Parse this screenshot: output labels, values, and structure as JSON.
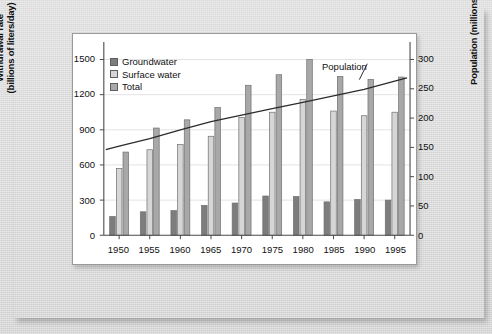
{
  "figure": {
    "background_color": "#d9d9d9",
    "plot_background_color": "#ffffff"
  },
  "legend": {
    "position": "top-left-inside",
    "items": [
      {
        "label": "Groundwater",
        "color": "#7d7d7d",
        "icon": "legend-swatch-icon"
      },
      {
        "label": "Surface water",
        "color": "#d6d6d6",
        "icon": "legend-swatch-icon"
      },
      {
        "label": "Total",
        "color": "#a8a8a8",
        "icon": "legend-swatch-icon"
      }
    ]
  },
  "annotations": [
    {
      "text": "Population",
      "target": "population-trend-line"
    }
  ],
  "chart_data": {
    "type": "bar",
    "title": "",
    "xlabel": "",
    "ylabel": "Withdrawal rate\n(billions of liters/day)",
    "y2label": "Population (millions)",
    "grid": true,
    "categories": [
      "1950",
      "1955",
      "1960",
      "1965",
      "1970",
      "1975",
      "1980",
      "1985",
      "1990",
      "1995"
    ],
    "ylim": [
      0,
      1650
    ],
    "yticks": [
      0,
      300,
      600,
      900,
      1200,
      1500
    ],
    "ytick_labels": [
      "0",
      "300",
      "600",
      "900",
      "1200",
      "1500"
    ],
    "y2lim": [
      0,
      330
    ],
    "y2ticks": [
      0,
      50,
      100,
      150,
      200,
      250,
      300
    ],
    "y2tick_labels": [
      "0",
      "50",
      "100",
      "150",
      "200",
      "250",
      "300"
    ],
    "series": [
      {
        "name": "Groundwater",
        "color": "#7d7d7d",
        "axis": "left",
        "values": [
          160,
          200,
          210,
          255,
          275,
          335,
          330,
          285,
          305,
          300
        ]
      },
      {
        "name": "Surface water",
        "color": "#d6d6d6",
        "axis": "left",
        "values": [
          570,
          730,
          775,
          845,
          1005,
          1050,
          1160,
          1060,
          1020,
          1050
        ]
      },
      {
        "name": "Total",
        "color": "#a8a8a8",
        "axis": "left",
        "values": [
          710,
          915,
          985,
          1090,
          1280,
          1370,
          1500,
          1355,
          1330,
          1350
        ]
      }
    ],
    "line_series": [
      {
        "name": "Population",
        "color": "#2b2b2b",
        "axis": "right",
        "x": [
          "1950",
          "1955",
          "1960",
          "1965",
          "1970",
          "1975",
          "1980",
          "1985",
          "1990",
          "1995"
        ],
        "values": [
          152,
          165,
          180,
          194,
          205,
          216,
          227,
          238,
          249,
          263
        ]
      }
    ]
  }
}
